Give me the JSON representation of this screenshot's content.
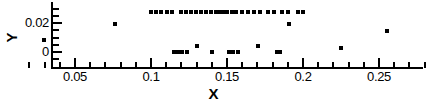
{
  "chart_data": {
    "type": "scatter",
    "title": "",
    "xlabel": "X",
    "ylabel": "Y",
    "xlim": [
      0.019,
      0.294
    ],
    "ylim": [
      -0.0048,
      0.0324
    ],
    "grid": false,
    "legend": null,
    "x_ticks_major": [
      0.05,
      0.1,
      0.15,
      0.2,
      0.25
    ],
    "x_ticklabels": [
      "0.05",
      "0.1",
      "0.15",
      "0.2",
      "0.25"
    ],
    "x_ticks_minor": [
      0.02,
      0.03,
      0.04,
      0.06,
      0.07,
      0.08,
      0.09,
      0.11,
      0.12,
      0.13,
      0.14,
      0.16,
      0.17,
      0.18,
      0.19,
      0.21,
      0.22,
      0.23,
      0.24,
      0.26,
      0.27,
      0.28,
      0.29
    ],
    "y_ticks_major": [
      0.0,
      0.02
    ],
    "y_ticklabels": [
      "0",
      "0.02"
    ],
    "y_ticks_minor": [
      -0.005,
      0.005,
      0.01,
      0.015,
      0.025,
      0.03
    ],
    "marker": "square",
    "marker_color": "#000000",
    "marker_size_px": 4,
    "series": [
      {
        "name": "data",
        "points": [
          [
            0.0295,
            0.0083
          ],
          [
            0.076,
            0.0193
          ],
          [
            0.1,
            0.0276
          ],
          [
            0.103,
            0.0276
          ],
          [
            0.1065,
            0.0276
          ],
          [
            0.1105,
            0.0276
          ],
          [
            0.114,
            0.0276
          ],
          [
            0.115,
            0.0
          ],
          [
            0.1175,
            0.0
          ],
          [
            0.12,
            0.0276
          ],
          [
            0.1205,
            0.0
          ],
          [
            0.123,
            0.0276
          ],
          [
            0.124,
            0.0
          ],
          [
            0.1265,
            0.0276
          ],
          [
            0.1295,
            0.0276
          ],
          [
            0.13,
            0.0041
          ],
          [
            0.133,
            0.0276
          ],
          [
            0.136,
            0.0276
          ],
          [
            0.1395,
            0.0276
          ],
          [
            0.14,
            0.0
          ],
          [
            0.1425,
            0.0276
          ],
          [
            0.145,
            0.0276
          ],
          [
            0.1475,
            0.0276
          ],
          [
            0.15,
            0.0276
          ],
          [
            0.151,
            0.0
          ],
          [
            0.153,
            0.0276
          ],
          [
            0.154,
            0.0
          ],
          [
            0.156,
            0.0276
          ],
          [
            0.157,
            0.0
          ],
          [
            0.16,
            0.0276
          ],
          [
            0.164,
            0.0276
          ],
          [
            0.168,
            0.0276
          ],
          [
            0.1705,
            0.0041
          ],
          [
            0.172,
            0.0276
          ],
          [
            0.177,
            0.0276
          ],
          [
            0.181,
            0.0276
          ],
          [
            0.183,
            0.0
          ],
          [
            0.185,
            0.0
          ],
          [
            0.186,
            0.0276
          ],
          [
            0.19,
            0.0276
          ],
          [
            0.191,
            0.0193
          ],
          [
            0.197,
            0.0276
          ],
          [
            0.2,
            0.0276
          ],
          [
            0.225,
            0.0028
          ],
          [
            0.2555,
            0.0145
          ],
          [
            0.2915,
            0.0124
          ]
        ]
      }
    ]
  },
  "axes": {
    "x_title": "X",
    "y_title": "Y"
  }
}
